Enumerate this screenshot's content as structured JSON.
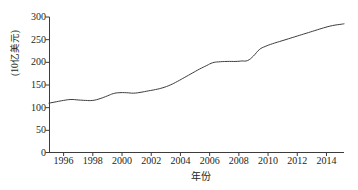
{
  "chart_data": {
    "type": "line",
    "title": "",
    "xlabel": "年份",
    "ylabel": "(10亿美元)",
    "xlim": [
      1995,
      2015.2
    ],
    "ylim": [
      0,
      300
    ],
    "grid": false,
    "legend": "none",
    "y_ticks": [
      0,
      50,
      100,
      150,
      200,
      250,
      300
    ],
    "x_ticks": [
      1996,
      1998,
      2000,
      2002,
      2004,
      2006,
      2008,
      2010,
      2012,
      2014
    ],
    "x_tick_labels": [
      "1996",
      "1998",
      "2000",
      "2002",
      "2004",
      "2006",
      "2008",
      "2010",
      "2012",
      "2014"
    ],
    "y_tick_labels": [
      "0",
      "50",
      "100",
      "150",
      "200",
      "250",
      "300"
    ],
    "line_color": "#3c3c3c",
    "line_width": 1,
    "series": [
      {
        "name": "",
        "x": [
          1995.0,
          1995.5,
          1996.0,
          1996.5,
          1997.0,
          1997.5,
          1998.0,
          1998.5,
          1999.0,
          1999.4,
          1999.8,
          2000.3,
          2000.8,
          2001.3,
          2001.8,
          2002.3,
          2002.8,
          2003.3,
          2003.8,
          2004.3,
          2004.8,
          2005.3,
          2005.8,
          2006.2,
          2006.6,
          2007.2,
          2007.8,
          2008.2,
          2008.6,
          2009.0,
          2009.4,
          2009.8,
          2010.3,
          2010.8,
          2011.4,
          2012.0,
          2012.6,
          2013.2,
          2013.8,
          2014.4,
          2015.0,
          2015.2
        ],
        "y": [
          110,
          113,
          116,
          118,
          117,
          116,
          116,
          120,
          126,
          131,
          133,
          133,
          132,
          134,
          137,
          140,
          144,
          150,
          158,
          167,
          176,
          185,
          193,
          199,
          201,
          202,
          202,
          203,
          204,
          214,
          228,
          235,
          241,
          246,
          252,
          258,
          264,
          270,
          276,
          281,
          284,
          285
        ]
      }
    ]
  }
}
